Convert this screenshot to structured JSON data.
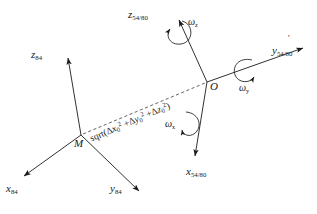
{
  "figure": {
    "kind": "coordinate-transformation-diagram",
    "stroke_color": "#1a1a1a",
    "dash_color": "#555555",
    "background": "#ffffff"
  },
  "points": [
    {
      "id": "M",
      "label": "M",
      "x": 81,
      "y": 135,
      "role": "origin-of-frame-84"
    },
    {
      "id": "O",
      "label": "O",
      "x": 207,
      "y": 82,
      "role": "origin-of-frame-5480"
    }
  ],
  "frames": [
    {
      "id": "frame-84",
      "origin": "M",
      "axes": [
        {
          "id": "z84",
          "letter": "z",
          "subscript": "84",
          "label_x": 31,
          "label_y": 48,
          "tip_x": 68,
          "tip_y": 56,
          "tail_x": 81,
          "tail_y": 135
        },
        {
          "id": "x84",
          "letter": "x",
          "subscript": "84",
          "label_x": 6,
          "label_y": 186,
          "tip_x": 22,
          "tip_y": 177,
          "tail_x": 81,
          "tail_y": 135
        },
        {
          "id": "y84",
          "letter": "y",
          "subscript": "84",
          "label_x": 110,
          "label_y": 186,
          "tip_x": 141,
          "tip_y": 192,
          "tail_x": 81,
          "tail_y": 135
        }
      ]
    },
    {
      "id": "frame-5480",
      "origin": "O",
      "axes": [
        {
          "id": "z5480",
          "letter": "z",
          "subscript": "54/80",
          "label_x": 128,
          "label_y": 10,
          "tip_x": 177,
          "tip_y": 18,
          "tail_x": 207,
          "tail_y": 82
        },
        {
          "id": "x5480",
          "letter": "x",
          "subscript": "54/80",
          "label_x": 188,
          "label_y": 170,
          "tip_x": 194,
          "tip_y": 157,
          "tail_x": 207,
          "tail_y": 82
        },
        {
          "id": "y5480",
          "letter": "y",
          "subscript": "54/80",
          "label_x": 272,
          "label_y": 47,
          "tip_x": 305,
          "tip_y": 47,
          "tail_x": 207,
          "tail_y": 82,
          "has_prime": true
        }
      ]
    }
  ],
  "rotations": [
    {
      "id": "omega-z",
      "symbol": "ω",
      "subscript": "z",
      "label_x": 188,
      "label_y": 20,
      "pivot_x": 176,
      "pivot_y": 33
    },
    {
      "id": "omega-y",
      "symbol": "ω",
      "subscript": "y",
      "label_x": 239,
      "label_y": 86,
      "pivot_x": 243,
      "pivot_y": 70
    },
    {
      "id": "omega-x",
      "symbol": "ω",
      "subscript": "x",
      "label_x": 167,
      "label_y": 122,
      "pivot_x": 190,
      "pivot_y": 124
    }
  ],
  "distance_line": {
    "id": "distance-vector",
    "from": "M",
    "to": "O",
    "style": "dashed",
    "formula_text": "sqrt(Δx₀² + Δy₀² + Δz₀²)",
    "formula_parts": {
      "fn": "sqrt(",
      "t1_delta": "Δ",
      "t1_var": "x",
      "t1_sub": "0",
      "t1_pow": "2",
      "plus1": "+",
      "t2_delta": "Δ",
      "t2_var": "y",
      "t2_sub": "0",
      "t2_pow": "2",
      "plus2": "+",
      "t3_delta": "Δ",
      "t3_var": "z",
      "t3_sub": "0",
      "t3_pow": "2",
      "close": ")"
    },
    "label_x": 88,
    "label_y": 133,
    "angle_deg": -23
  }
}
